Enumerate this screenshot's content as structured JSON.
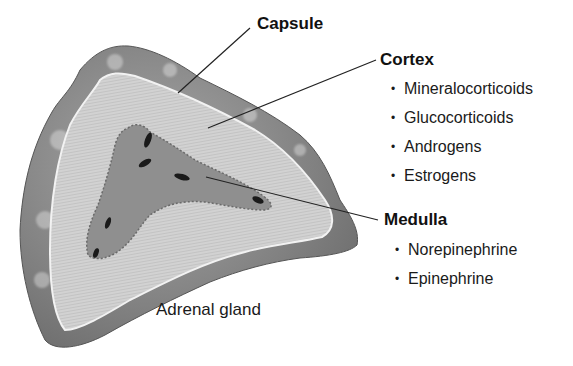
{
  "diagram": {
    "subject": "Adrenal gland",
    "caption": "Adrenal gland",
    "labels": {
      "capsule": {
        "title": "Capsule"
      },
      "cortex": {
        "title": "Cortex",
        "items": [
          "Mineralocorticoids",
          "Glucocorticoids",
          "Androgens",
          "Estrogens"
        ]
      },
      "medulla": {
        "title": "Medulla",
        "items": [
          "Norepinephrine",
          "Epinephrine"
        ]
      }
    },
    "bullet": "•",
    "colors": {
      "capsule": "#7d7d7d",
      "cortex": "#cfcfcf",
      "medulla": "#8e8e8e",
      "leader_line": "#222222"
    }
  }
}
